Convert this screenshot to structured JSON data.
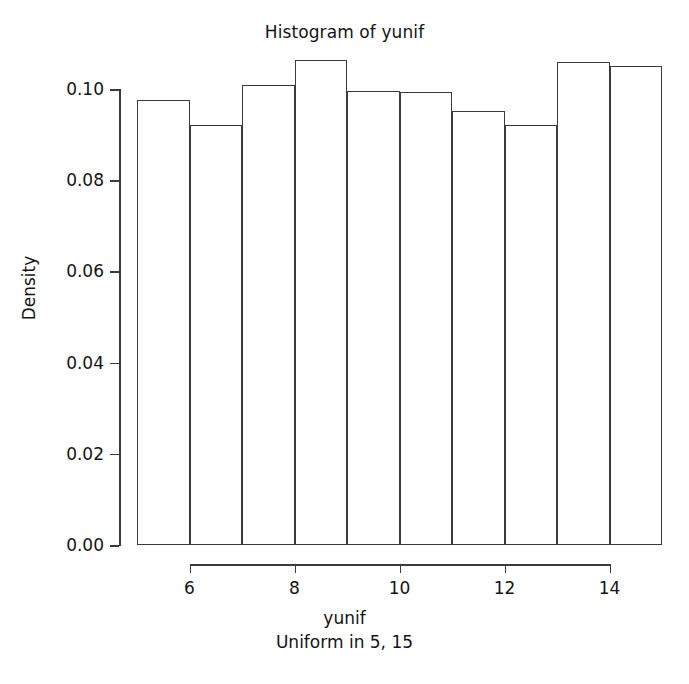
{
  "chart_data": {
    "type": "bar",
    "subtype": "histogram",
    "title": "Histogram of yunif",
    "subtitle": "Uniform in 5, 15",
    "xlabel": "yunif",
    "ylabel": "Density",
    "grid": false,
    "legend": false,
    "xlim": [
      5,
      15
    ],
    "ylim": [
      0.0,
      0.107
    ],
    "bin_width": 1,
    "bin_edges": [
      5,
      6,
      7,
      8,
      9,
      10,
      11,
      12,
      13,
      14,
      15
    ],
    "bin_centers": [
      5.5,
      6.5,
      7.5,
      8.5,
      9.5,
      10.5,
      11.5,
      12.5,
      13.5,
      14.5
    ],
    "values": [
      0.0976,
      0.092,
      0.1008,
      0.1064,
      0.0996,
      0.0994,
      0.0952,
      0.0922,
      0.106,
      0.105
    ],
    "x_ticks": [
      6,
      8,
      10,
      12,
      14
    ],
    "x_tick_labels": [
      "6",
      "8",
      "10",
      "12",
      "14"
    ],
    "y_ticks": [
      0.0,
      0.02,
      0.04,
      0.06,
      0.08,
      0.1
    ],
    "y_tick_labels": [
      "0.00",
      "0.02",
      "0.04",
      "0.06",
      "0.08",
      "0.10"
    ],
    "bar_edge_color": "#3b3b3b",
    "bar_fill_color": "transparent",
    "axis_color": "#3b3b3b",
    "text_color": "#141414",
    "background_color": "#ffffff"
  }
}
